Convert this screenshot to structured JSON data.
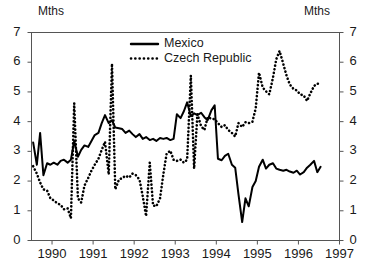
{
  "chart_data": {
    "type": "line",
    "title": "",
    "subtitle": "",
    "xlabel": "",
    "ylabel": "Mths",
    "ylabel_right": "Mths",
    "unit": "Mths",
    "grid": false,
    "legend_position": "top-center",
    "xlim": [
      1989.5,
      1997.0
    ],
    "ylim": [
      0,
      7
    ],
    "yticks": [
      0,
      1,
      2,
      3,
      4,
      5,
      6,
      7
    ],
    "xticks": [
      1990,
      1991,
      1992,
      1993,
      1994,
      1995,
      1996,
      1997
    ],
    "xtick_labels": [
      "1990",
      "1991",
      "1992",
      "1993",
      "1994",
      "1995",
      "1996",
      "1997"
    ],
    "ytick_labels": [
      "0",
      "1",
      "2",
      "3",
      "4",
      "5",
      "6",
      "7"
    ],
    "colors": {
      "mexico": "#000000",
      "czech": "#000000",
      "axis": "#555555",
      "background": "#ffffff"
    },
    "series": [
      {
        "name": "Mexico",
        "style": "solid",
        "x": [
          1989.54,
          1989.63,
          1989.71,
          1989.79,
          1989.88,
          1989.96,
          1990.04,
          1990.13,
          1990.21,
          1990.29,
          1990.38,
          1990.46,
          1990.54,
          1990.63,
          1990.71,
          1990.79,
          1990.88,
          1990.96,
          1991.04,
          1991.13,
          1991.21,
          1991.29,
          1991.38,
          1991.46,
          1991.54,
          1991.63,
          1991.71,
          1991.79,
          1991.88,
          1991.96,
          1992.04,
          1992.13,
          1992.21,
          1992.29,
          1992.38,
          1992.46,
          1992.54,
          1992.63,
          1992.71,
          1992.79,
          1992.88,
          1992.96,
          1993.04,
          1993.13,
          1993.21,
          1993.29,
          1993.38,
          1993.46,
          1993.54,
          1993.63,
          1993.71,
          1993.79,
          1993.88,
          1993.96,
          1994.04,
          1994.13,
          1994.21,
          1994.29,
          1994.38,
          1994.46,
          1994.54,
          1994.63,
          1994.71,
          1994.79,
          1994.88,
          1994.96,
          1995.04,
          1995.13,
          1995.21,
          1995.29,
          1995.38,
          1995.46,
          1995.54,
          1995.63,
          1995.71,
          1995.79,
          1995.88,
          1995.96,
          1996.04,
          1996.13,
          1996.21,
          1996.29,
          1996.38,
          1996.46,
          1996.54
        ],
        "values": [
          3.3,
          2.55,
          3.62,
          2.2,
          2.6,
          2.55,
          2.62,
          2.55,
          2.68,
          2.72,
          2.62,
          2.72,
          3.35,
          2.82,
          3.05,
          3.2,
          3.15,
          3.35,
          3.55,
          3.62,
          3.95,
          4.22,
          3.95,
          4.05,
          3.8,
          3.78,
          3.75,
          3.62,
          3.7,
          3.58,
          3.48,
          3.58,
          3.42,
          3.48,
          3.38,
          3.42,
          3.35,
          3.45,
          3.42,
          3.45,
          3.38,
          3.42,
          4.25,
          4.12,
          4.35,
          4.65,
          4.18,
          4.28,
          4.22,
          4.3,
          4.15,
          4.05,
          4.38,
          4.55,
          2.75,
          2.7,
          2.85,
          2.92,
          2.55,
          2.45,
          1.55,
          0.62,
          1.42,
          1.15,
          1.8,
          2.0,
          2.48,
          2.72,
          2.42,
          2.55,
          2.6,
          2.42,
          2.38,
          2.35,
          2.38,
          2.32,
          2.28,
          2.35,
          2.22,
          2.3,
          2.45,
          2.55,
          2.68,
          2.3,
          2.48
        ]
      },
      {
        "name": "Czech Republic",
        "style": "dotted",
        "x": [
          1989.54,
          1989.63,
          1989.71,
          1989.79,
          1989.88,
          1989.96,
          1990.04,
          1990.13,
          1990.21,
          1990.29,
          1990.38,
          1990.46,
          1990.54,
          1990.63,
          1990.71,
          1990.79,
          1990.88,
          1990.96,
          1991.04,
          1991.13,
          1991.21,
          1991.29,
          1991.38,
          1991.46,
          1991.54,
          1991.63,
          1991.71,
          1991.79,
          1991.88,
          1991.96,
          1992.04,
          1992.13,
          1992.21,
          1992.29,
          1992.38,
          1992.46,
          1992.54,
          1992.63,
          1992.71,
          1992.79,
          1992.88,
          1992.96,
          1993.04,
          1993.13,
          1993.21,
          1993.29,
          1993.38,
          1993.46,
          1993.54,
          1993.63,
          1993.71,
          1993.79,
          1993.88,
          1993.96,
          1994.04,
          1994.13,
          1994.21,
          1994.29,
          1994.38,
          1994.46,
          1994.54,
          1994.63,
          1994.71,
          1994.79,
          1994.88,
          1994.96,
          1995.04,
          1995.13,
          1995.21,
          1995.29,
          1995.38,
          1995.46,
          1995.54,
          1995.63,
          1995.71,
          1995.79,
          1995.88,
          1995.96,
          1996.04,
          1996.13,
          1996.21,
          1996.29,
          1996.38,
          1996.46,
          1996.54
        ],
        "values": [
          2.5,
          2.25,
          1.95,
          1.72,
          1.68,
          1.42,
          1.35,
          1.25,
          1.2,
          1.05,
          1.08,
          0.75,
          4.62,
          1.42,
          1.28,
          1.85,
          2.1,
          2.35,
          2.55,
          2.75,
          3.05,
          3.32,
          2.22,
          5.95,
          1.72,
          2.05,
          2.1,
          2.18,
          2.12,
          2.25,
          2.2,
          2.05,
          1.48,
          0.82,
          2.62,
          1.18,
          1.15,
          1.42,
          2.22,
          2.92,
          3.02,
          2.72,
          2.68,
          2.72,
          2.62,
          2.72,
          5.55,
          2.42,
          4.25,
          3.85,
          3.72,
          4.15,
          4.1,
          4.08,
          3.95,
          3.82,
          3.88,
          3.72,
          3.62,
          3.5,
          3.95,
          3.82,
          3.98,
          3.95,
          4.0,
          4.45,
          5.65,
          5.15,
          5.02,
          4.92,
          5.48,
          6.1,
          6.38,
          5.95,
          5.55,
          5.25,
          5.1,
          5.05,
          4.92,
          4.88,
          4.7,
          4.95,
          5.2,
          5.28,
          5.25
        ]
      }
    ]
  },
  "axes": {
    "unit_left": "Mths",
    "unit_right": "Mths"
  },
  "legend": {
    "entries": [
      {
        "label": "Mexico",
        "style": "solid"
      },
      {
        "label": "Czech Republic",
        "style": "dotted"
      }
    ]
  }
}
